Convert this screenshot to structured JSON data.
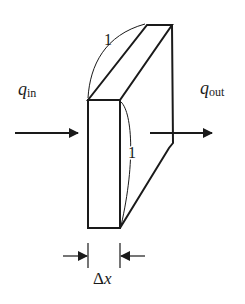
{
  "diagram": {
    "labels": {
      "q_in_main": "q",
      "q_in_sub": "in",
      "q_out_main": "q",
      "q_out_sub": "out",
      "depth_unit": "1",
      "height_unit": "1",
      "thickness_delta": "Δ",
      "thickness_var": "x"
    },
    "colors": {
      "stroke": "#1a1a1a",
      "background": "#ffffff"
    }
  }
}
